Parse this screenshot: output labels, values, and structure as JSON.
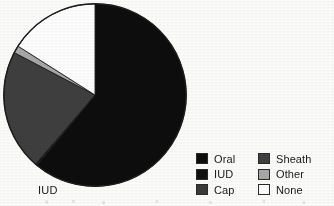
{
  "figure": {
    "background_color": "#fdfdfc",
    "slice_label": "IUD"
  },
  "legend": {
    "columns": [
      {
        "entries": [
          {
            "label": "Oral",
            "color": "#0d0d0d",
            "border": "#2b2b2b"
          },
          {
            "label": "IUD",
            "color": "#111111",
            "border": "#2b2b2b"
          },
          {
            "label": "Cap",
            "color": "#3a3a3a",
            "border": "#2b2b2b"
          }
        ]
      },
      {
        "entries": [
          {
            "label": "Sheath",
            "color": "#3f3f3f",
            "border": "#2b2b2b"
          },
          {
            "label": "Other",
            "color": "#a9a9a9",
            "border": "#2b2b2b"
          },
          {
            "label": "None",
            "color": "#ffffff",
            "border": "#2b2b2b"
          }
        ]
      }
    ]
  },
  "chart_data": {
    "type": "pie",
    "title": "",
    "subtitle": "",
    "xlabel": "",
    "ylabel": "",
    "grid": false,
    "legend_position": "bottom-right",
    "start_angle_deg": 0,
    "direction": "clockwise",
    "center_px": [
      95,
      95
    ],
    "radius_px": 92,
    "annotations": [
      {
        "text": "IUD",
        "points_to": "IUD",
        "position_px": [
          40,
          190
        ]
      }
    ],
    "categories": [
      "Oral",
      "IUD",
      "Cap",
      "Sheath",
      "Other",
      "None"
    ],
    "values": [
      61.0,
      0.3,
      0.0,
      21.4,
      1.3,
      16.0
    ],
    "unit": "percent",
    "slices": [
      {
        "label": "Oral",
        "value": 61.0,
        "color": "#0d0d0d",
        "start_deg": 0.0,
        "end_deg": 219.6
      },
      {
        "label": "IUD",
        "value": 0.3,
        "color": "#111111",
        "start_deg": 219.6,
        "end_deg": 220.7
      },
      {
        "label": "Cap",
        "value": 0.0,
        "color": "#3a3a3a",
        "start_deg": 220.7,
        "end_deg": 220.7
      },
      {
        "label": "Sheath",
        "value": 21.4,
        "color": "#3f3f3f",
        "start_deg": 220.7,
        "end_deg": 297.7
      },
      {
        "label": "Other",
        "value": 1.3,
        "color": "#a9a9a9",
        "start_deg": 297.7,
        "end_deg": 302.4
      },
      {
        "label": "None",
        "value": 16.0,
        "color": "#ffffff",
        "start_deg": 302.4,
        "end_deg": 360.0
      }
    ]
  }
}
